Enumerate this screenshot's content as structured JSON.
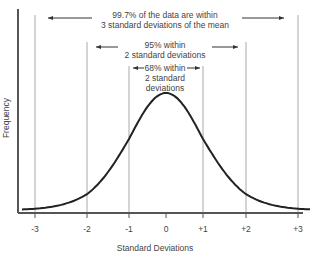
{
  "chart_data": {
    "type": "line",
    "title": "",
    "xlabel": "Standard Deviations",
    "ylabel": "Frequency",
    "x_ticks": [
      "-3",
      "-2",
      "-1",
      "0",
      "+1",
      "+2",
      "+3"
    ],
    "x_tick_values": [
      -3,
      -2,
      -1,
      0,
      1,
      2,
      3
    ],
    "series": [
      {
        "name": "Normal distribution",
        "function": "gaussian",
        "mean": 0,
        "std": 1
      }
    ],
    "xlim": [
      -3.4,
      3.4
    ],
    "grid": false,
    "annotations": [
      {
        "range": [
          -3,
          3
        ],
        "text_line1": "99.7% of the data are within",
        "text_line2": "3 standard deviations of the mean"
      },
      {
        "range": [
          -2,
          2
        ],
        "text_line1": "95% within",
        "text_line2": "2 standard deviations"
      },
      {
        "range": [
          -1,
          1
        ],
        "text_line1": "68% within",
        "text_line2": "2 standard",
        "text_line3": "deviations"
      }
    ]
  },
  "colors": {
    "curve": "#222222",
    "axis": "#444444",
    "guide": "#aaaaaa"
  }
}
